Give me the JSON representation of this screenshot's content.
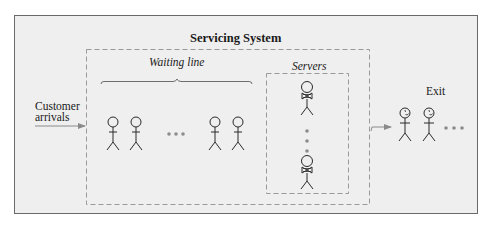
{
  "diagram": {
    "title": "Servicing System",
    "waiting_line_label": "Waiting line",
    "servers_label": "Servers",
    "arrivals_label_line1": "Customer",
    "arrivals_label_line2": "arrivals",
    "exit_label": "Exit",
    "colors": {
      "background": "#efefef",
      "frame_border": "#6a6a6a",
      "dashed_border": "#9a9a9a",
      "figure_stroke": "#2a2a2a",
      "arrow": "#8a8a8a",
      "ellipsis_dots": "#8c8c8c"
    },
    "waiting_customers_visible": 4,
    "servers_visible": 2,
    "exited_customers_visible": 2
  }
}
